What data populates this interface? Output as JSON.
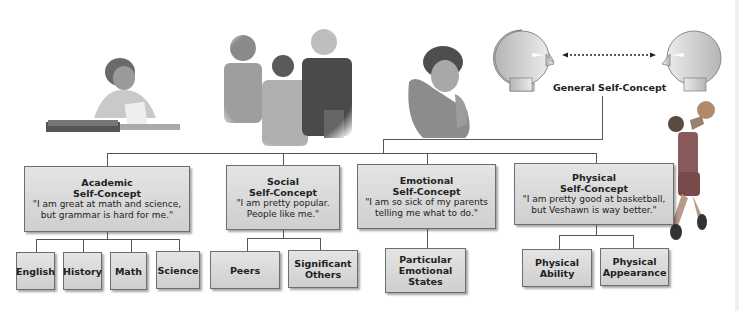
{
  "diagram": {
    "root": {
      "label": "General Self-Concept"
    },
    "categories": [
      {
        "title_line1": "Academic",
        "title_line2": "Self-Concept",
        "quote_line1": "\"I am great at math and science,",
        "quote_line2": "but grammar is hard for me.\"",
        "children": [
          "English",
          "History",
          "Math",
          "Science"
        ]
      },
      {
        "title_line1": "Social",
        "title_line2": "Self-Concept",
        "quote_line1": "\"I am pretty popular.",
        "quote_line2": "People like me.\"",
        "children": [
          "Peers",
          "Significant Others"
        ]
      },
      {
        "title_line1": "Emotional",
        "title_line2": "Self-Concept",
        "quote_line1": "\"I am so sick of my parents",
        "quote_line2": "telling me what to do.\"",
        "children": [
          "Particular Emotional States"
        ]
      },
      {
        "title_line1": "Physical",
        "title_line2": "Self-Concept",
        "quote_line1": "\"I am pretty good at basketball,",
        "quote_line2": "but Veshawn is way better.\"",
        "children": [
          "Physical Ability",
          "Physical Appearance"
        ]
      }
    ],
    "illustrations": [
      "student-reading-illustration",
      "group-of-friends-illustration",
      "pensive-teen-illustration",
      "two-heads-reflection-illustration",
      "basketball-player-illustration"
    ],
    "colors": {
      "box_fill_top": "#e4e4e4",
      "box_fill_bottom": "#cfcfcf",
      "box_border": "#6e6e6e",
      "line": "#555555",
      "text": "#222222"
    }
  }
}
